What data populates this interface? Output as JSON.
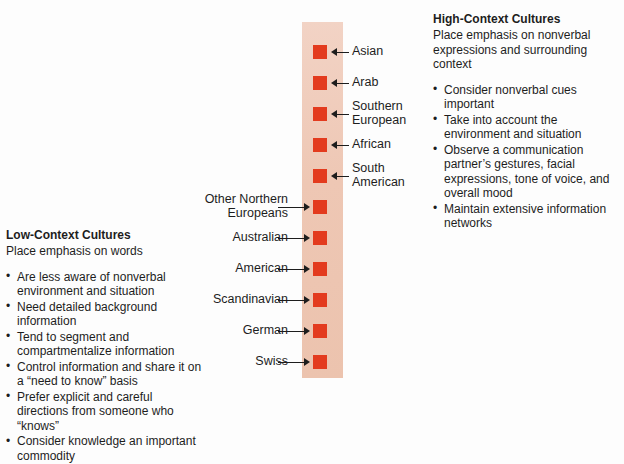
{
  "figure": {
    "type": "cultural-context-continuum",
    "column": {
      "name": "context-continuum-column",
      "gradient_top_color": "#f2d3c5",
      "gradient_bottom_color": "#ecc3ae",
      "marker_color": "#e33b1e"
    },
    "markers": [
      {
        "label": "Asian",
        "side": "right",
        "y": 45,
        "lines": 1
      },
      {
        "label": "Arab",
        "side": "right",
        "y": 76,
        "lines": 1
      },
      {
        "label": "Southern\nEuropean",
        "side": "right",
        "y": 107,
        "lines": 2
      },
      {
        "label": "African",
        "side": "right",
        "y": 138,
        "lines": 1
      },
      {
        "label": "South\nAmerican",
        "side": "right",
        "y": 169,
        "lines": 2
      },
      {
        "label": "Other Northern\nEuropeans",
        "side": "left",
        "y": 200,
        "lines": 2
      },
      {
        "label": "Australian",
        "side": "left",
        "y": 231,
        "lines": 1
      },
      {
        "label": "American",
        "side": "left",
        "y": 262,
        "lines": 1
      },
      {
        "label": "Scandinavian",
        "side": "left",
        "y": 293,
        "lines": 1
      },
      {
        "label": "German",
        "side": "left",
        "y": 324,
        "lines": 1
      },
      {
        "label": "Swiss",
        "side": "left",
        "y": 355,
        "lines": 1
      }
    ]
  },
  "low_context": {
    "title": "Low-Context Cultures",
    "subtitle": "Place emphasis on words",
    "bullets": [
      "Are less aware of nonverbal environment and situation",
      "Need detailed background information",
      "Tend to segment and compartmentalize information",
      "Control information and share it on a “need to know” basis",
      "Prefer explicit and careful directions from someone who “knows”",
      "Consider knowledge an important commodity"
    ]
  },
  "high_context": {
    "title": "High-Context Cultures",
    "subtitle": "Place emphasis on nonverbal expressions and surrounding context",
    "bullets": [
      "Consider nonverbal cues important",
      "Take into account the environment and situation",
      "Observe a communication partner’s gestures, facial expressions, tone of voice, and overall mood",
      "Maintain extensive information networks"
    ]
  }
}
